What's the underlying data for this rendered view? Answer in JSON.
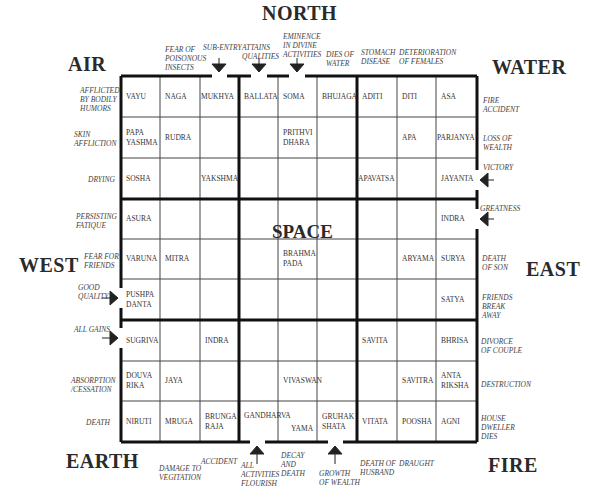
{
  "directions": {
    "north": "NORTH",
    "east": "EAST",
    "west": "WEST",
    "air": "AIR",
    "water": "WATER",
    "earth": "EARTH",
    "fire": "FIRE",
    "center": "SPACE"
  },
  "top_notes": [
    {
      "line1": "FEAR OF",
      "line2": "POISONOUS",
      "line3": "INSECTS"
    },
    {
      "line1": "SUB-ENTRY",
      "line2": "",
      "line3": ""
    },
    {
      "line1": "ATTAINS",
      "line2": "QUALITIES",
      "line3": ""
    },
    {
      "line1": "EMINENCE",
      "line2": "IN DIVINE",
      "line3": "ACTIVITIES"
    },
    {
      "line1": "DIES OF",
      "line2": "WATER",
      "line3": ""
    },
    {
      "line1": "STOMACH",
      "line2": "DISEASE",
      "line3": ""
    },
    {
      "line1": "DETERIORATION",
      "line2": "OF FEMALES",
      "line3": ""
    }
  ],
  "left_notes": [
    {
      "line1": "AFFLICTED",
      "line2": "BY BODILY",
      "line3": "HUMORS"
    },
    {
      "line1": "SKIN",
      "line2": "AFFLICTION",
      "line3": ""
    },
    {
      "line1": "DRYING",
      "line2": "",
      "line3": ""
    },
    {
      "line1": "PERSISTING",
      "line2": "FATIQUE",
      "line3": ""
    },
    {
      "line1": "FEAR FOR",
      "line2": "FRIENDS",
      "line3": ""
    },
    {
      "line1": "GOOD",
      "line2": "QUALITY",
      "line3": ""
    },
    {
      "line1": "ALL GAINS",
      "line2": "",
      "line3": ""
    },
    {
      "line1": "ABSORPTION",
      "line2": "/CESSATION",
      "line3": ""
    },
    {
      "line1": "DEATH",
      "line2": "",
      "line3": ""
    }
  ],
  "right_notes": [
    {
      "line1": "FIRE",
      "line2": "ACCIDENT",
      "line3": ""
    },
    {
      "line1": "LOSS OF",
      "line2": "WEALTH",
      "line3": ""
    },
    {
      "line1": "VICTORY",
      "line2": "",
      "line3": ""
    },
    {
      "line1": "GREATNESS",
      "line2": "",
      "line3": ""
    },
    {
      "line1": "DEATH",
      "line2": "OF SON",
      "line3": ""
    },
    {
      "line1": "FRIENDS",
      "line2": "BREAK",
      "line3": "AWAY"
    },
    {
      "line1": "DIVORCE",
      "line2": "OF COUPLE",
      "line3": ""
    },
    {
      "line1": "DESTRUCTION",
      "line2": "",
      "line3": ""
    },
    {
      "line1": "HOUSE",
      "line2": "DWELLER",
      "line3": "DIES"
    }
  ],
  "bottom_notes": [
    {
      "line1": "DAMAGE TO",
      "line2": "VEGITATION",
      "line3": ""
    },
    {
      "line1": "ACCIDENT",
      "line2": "",
      "line3": ""
    },
    {
      "line1": "ALL",
      "line2": "ACTIVITIES",
      "line3": "FLOURISH"
    },
    {
      "line1": "DECAY",
      "line2": "AND",
      "line3": "DEATH"
    },
    {
      "line1": "GROWTH",
      "line2": "OF WEALTH",
      "line3": ""
    },
    {
      "line1": "DEATH OF",
      "line2": "HUSBAND",
      "line3": ""
    },
    {
      "line1": "DRAUGHT",
      "line2": "",
      "line3": ""
    }
  ],
  "cells": [
    {
      "row": 0,
      "col": 0,
      "l1": "VAYU",
      "l2": ""
    },
    {
      "row": 0,
      "col": 1,
      "l1": "NAGA",
      "l2": ""
    },
    {
      "row": 0,
      "col": 2,
      "l1": "MUKHYA",
      "l2": ""
    },
    {
      "row": 0,
      "col": 3,
      "l1": "BALLATA",
      "l2": ""
    },
    {
      "row": 0,
      "col": 4,
      "l1": "SOMA",
      "l2": ""
    },
    {
      "row": 0,
      "col": 5,
      "l1": "BHUJAGA",
      "l2": ""
    },
    {
      "row": 0,
      "col": 6,
      "l1": "ADITI",
      "l2": ""
    },
    {
      "row": 0,
      "col": 7,
      "l1": "DITI",
      "l2": ""
    },
    {
      "row": 0,
      "col": 8,
      "l1": "ASA",
      "l2": ""
    },
    {
      "row": 1,
      "col": 0,
      "l1": "PAPA",
      "l2": "YASHMA"
    },
    {
      "row": 1,
      "col": 1,
      "l1": "RUDRA",
      "l2": ""
    },
    {
      "row": 1,
      "col": 4,
      "l1": "PRITHVI",
      "l2": "DHARA"
    },
    {
      "row": 1,
      "col": 7,
      "l1": "APA",
      "l2": ""
    },
    {
      "row": 1,
      "col": 8,
      "l1": "PARJANYA",
      "l2": ""
    },
    {
      "row": 2,
      "col": 0,
      "l1": "SOSHA",
      "l2": ""
    },
    {
      "row": 2,
      "col": 2,
      "l1": "YAKSHMA",
      "l2": ""
    },
    {
      "row": 2,
      "col": 6,
      "l1": "APAVATSA",
      "l2": ""
    },
    {
      "row": 2,
      "col": 8,
      "l1": "JAYANTA",
      "l2": ""
    },
    {
      "row": 3,
      "col": 0,
      "l1": "ASURA",
      "l2": ""
    },
    {
      "row": 3,
      "col": 8,
      "l1": "INDRA",
      "l2": ""
    },
    {
      "row": 4,
      "col": 0,
      "l1": "VARUNA",
      "l2": ""
    },
    {
      "row": 4,
      "col": 1,
      "l1": "MITRA",
      "l2": ""
    },
    {
      "row": 4,
      "col": 4,
      "l1": "BRAHMA",
      "l2": "PADA"
    },
    {
      "row": 4,
      "col": 7,
      "l1": "ARYAMA",
      "l2": ""
    },
    {
      "row": 4,
      "col": 8,
      "l1": "SURYA",
      "l2": ""
    },
    {
      "row": 5,
      "col": 0,
      "l1": "PUSHPA",
      "l2": "DANTA"
    },
    {
      "row": 5,
      "col": 8,
      "l1": "SATYA",
      "l2": ""
    },
    {
      "row": 6,
      "col": 0,
      "l1": "SUGRIVA",
      "l2": ""
    },
    {
      "row": 6,
      "col": 2,
      "l1": "INDRA",
      "l2": ""
    },
    {
      "row": 6,
      "col": 6,
      "l1": "SAVITA",
      "l2": ""
    },
    {
      "row": 6,
      "col": 8,
      "l1": "BHRISA",
      "l2": ""
    },
    {
      "row": 7,
      "col": 0,
      "l1": "DOUVA",
      "l2": "RIKA"
    },
    {
      "row": 7,
      "col": 1,
      "l1": "JAYA",
      "l2": ""
    },
    {
      "row": 7,
      "col": 4,
      "l1": "VIVASWAN",
      "l2": ""
    },
    {
      "row": 7,
      "col": 7,
      "l1": "SAVITRA",
      "l2": ""
    },
    {
      "row": 7,
      "col": 8,
      "l1": "ANTA",
      "l2": "RIKSHA"
    },
    {
      "row": 8,
      "col": 0,
      "l1": "NIRUTI",
      "l2": ""
    },
    {
      "row": 8,
      "col": 1,
      "l1": "MRUGA",
      "l2": ""
    },
    {
      "row": 8,
      "col": 2,
      "l1": "BRUNGA",
      "l2": "RAJA"
    },
    {
      "row": 8,
      "col": 3,
      "l1": "GANDHARVA",
      "l2": ""
    },
    {
      "row": 8,
      "col": 4,
      "l1": "YAMA",
      "l2": ""
    },
    {
      "row": 8,
      "col": 5,
      "l1": "GRUHAK",
      "l2": "SHATA"
    },
    {
      "row": 8,
      "col": 6,
      "l1": "VITATA",
      "l2": ""
    },
    {
      "row": 8,
      "col": 7,
      "l1": "POOSHA",
      "l2": ""
    },
    {
      "row": 8,
      "col": 8,
      "l1": "AGNI",
      "l2": ""
    }
  ]
}
